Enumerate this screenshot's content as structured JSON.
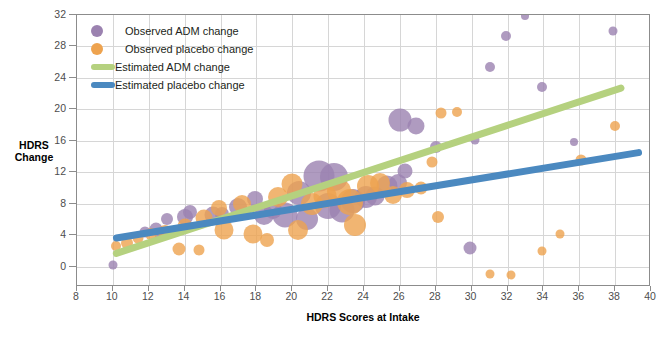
{
  "chart_data": {
    "type": "scatter",
    "title": "",
    "xlabel": "HDRS Scores at Intake",
    "ylabel": "HDRS Change",
    "ylabel_line1": "HDRS",
    "ylabel_line2": "Change",
    "xlim": [
      8,
      40
    ],
    "ylim": [
      -2.6,
      32
    ],
    "xticks": [
      8,
      10,
      12,
      14,
      16,
      18,
      20,
      22,
      24,
      26,
      28,
      30,
      32,
      34,
      36,
      38,
      40
    ],
    "yticks": [
      0,
      4,
      8,
      12,
      16,
      20,
      24,
      28,
      32
    ],
    "grid": true,
    "legend_position": "top-left",
    "colors": {
      "adm_marker": "#9b82b0",
      "placebo_marker": "#eea34f",
      "adm_line": "#b5d17f",
      "placebo_line": "#4b89c0",
      "grid": "#d6d6d6",
      "axis": "#8c8c8c"
    },
    "legend": [
      {
        "label": "Observed ADM change",
        "kind": "dot",
        "color": "#9b82b0"
      },
      {
        "label": "Observed placebo change",
        "kind": "dot",
        "color": "#eea34f"
      },
      {
        "label": "Estimated ADM change",
        "kind": "line",
        "color": "#b5d17f"
      },
      {
        "label": "Estimated placebo change",
        "kind": "line",
        "color": "#4b89c0"
      }
    ],
    "series": [
      {
        "name": "Observed ADM change",
        "marker": "bubble",
        "color": "#9b82b0",
        "points": [
          {
            "x": 10.0,
            "y": 0.2,
            "s": 4.5
          },
          {
            "x": 11.8,
            "y": 4.4,
            "s": 5.5
          },
          {
            "x": 12.4,
            "y": 4.8,
            "s": 6.5
          },
          {
            "x": 13.0,
            "y": 6.1,
            "s": 6.0
          },
          {
            "x": 12.6,
            "y": 3.9,
            "s": 5.0
          },
          {
            "x": 14.0,
            "y": 6.3,
            "s": 8.0
          },
          {
            "x": 14.3,
            "y": 7.0,
            "s": 7.0
          },
          {
            "x": 15.6,
            "y": 6.5,
            "s": 8.5
          },
          {
            "x": 16.1,
            "y": 6.7,
            "s": 7.0
          },
          {
            "x": 17.0,
            "y": 7.6,
            "s": 9.0
          },
          {
            "x": 17.9,
            "y": 8.6,
            "s": 8.0
          },
          {
            "x": 18.4,
            "y": 6.6,
            "s": 10.0
          },
          {
            "x": 18.9,
            "y": 7.2,
            "s": 9.0
          },
          {
            "x": 19.6,
            "y": 6.6,
            "s": 12.5
          },
          {
            "x": 20.4,
            "y": 9.4,
            "s": 12.0
          },
          {
            "x": 20.8,
            "y": 6.0,
            "s": 11.0
          },
          {
            "x": 21.5,
            "y": 11.5,
            "s": 15.5
          },
          {
            "x": 22.3,
            "y": 11.4,
            "s": 14.0
          },
          {
            "x": 22.0,
            "y": 7.7,
            "s": 13.0
          },
          {
            "x": 22.8,
            "y": 7.2,
            "s": 12.5
          },
          {
            "x": 23.4,
            "y": 8.3,
            "s": 12.0
          },
          {
            "x": 24.1,
            "y": 8.8,
            "s": 11.0
          },
          {
            "x": 24.6,
            "y": 9.0,
            "s": 9.5
          },
          {
            "x": 25.3,
            "y": 10.2,
            "s": 10.5
          },
          {
            "x": 25.9,
            "y": 10.6,
            "s": 9.0
          },
          {
            "x": 26.3,
            "y": 12.2,
            "s": 7.5
          },
          {
            "x": 26.0,
            "y": 18.6,
            "s": 11.5
          },
          {
            "x": 26.9,
            "y": 17.9,
            "s": 8.5
          },
          {
            "x": 28.0,
            "y": 15.2,
            "s": 6.0
          },
          {
            "x": 29.9,
            "y": 2.3,
            "s": 6.5
          },
          {
            "x": 30.2,
            "y": 16.1,
            "s": 4.5
          },
          {
            "x": 31.0,
            "y": 25.4,
            "s": 5.0
          },
          {
            "x": 31.9,
            "y": 29.3,
            "s": 5.0
          },
          {
            "x": 33.0,
            "y": 31.9,
            "s": 4.0
          },
          {
            "x": 33.9,
            "y": 22.9,
            "s": 5.0
          },
          {
            "x": 35.7,
            "y": 15.9,
            "s": 4.0
          },
          {
            "x": 37.9,
            "y": 30.0,
            "s": 4.5
          }
        ]
      },
      {
        "name": "Observed placebo change",
        "marker": "bubble",
        "color": "#eea34f",
        "points": [
          {
            "x": 10.2,
            "y": 2.6,
            "s": 5.0
          },
          {
            "x": 10.8,
            "y": 3.0,
            "s": 6.0
          },
          {
            "x": 11.4,
            "y": 3.6,
            "s": 5.5
          },
          {
            "x": 12.1,
            "y": 4.1,
            "s": 6.0
          },
          {
            "x": 12.9,
            "y": 4.4,
            "s": 7.0
          },
          {
            "x": 13.7,
            "y": 2.2,
            "s": 6.5
          },
          {
            "x": 14.0,
            "y": 5.2,
            "s": 7.5
          },
          {
            "x": 14.8,
            "y": 2.1,
            "s": 5.5
          },
          {
            "x": 15.1,
            "y": 6.2,
            "s": 8.5
          },
          {
            "x": 15.9,
            "y": 7.5,
            "s": 8.0
          },
          {
            "x": 16.2,
            "y": 4.6,
            "s": 9.5
          },
          {
            "x": 17.2,
            "y": 7.9,
            "s": 9.0
          },
          {
            "x": 17.8,
            "y": 4.1,
            "s": 9.5
          },
          {
            "x": 18.6,
            "y": 3.4,
            "s": 7.0
          },
          {
            "x": 19.2,
            "y": 8.9,
            "s": 10.0
          },
          {
            "x": 20.0,
            "y": 10.5,
            "s": 10.5
          },
          {
            "x": 20.3,
            "y": 4.6,
            "s": 10.0
          },
          {
            "x": 21.1,
            "y": 7.9,
            "s": 11.0
          },
          {
            "x": 21.8,
            "y": 9.0,
            "s": 11.5
          },
          {
            "x": 22.6,
            "y": 9.6,
            "s": 12.0
          },
          {
            "x": 23.2,
            "y": 8.2,
            "s": 13.0
          },
          {
            "x": 23.5,
            "y": 5.3,
            "s": 11.0
          },
          {
            "x": 24.2,
            "y": 10.3,
            "s": 11.0
          },
          {
            "x": 24.9,
            "y": 10.6,
            "s": 10.0
          },
          {
            "x": 25.6,
            "y": 9.1,
            "s": 9.0
          },
          {
            "x": 26.4,
            "y": 9.8,
            "s": 8.0
          },
          {
            "x": 27.2,
            "y": 10.0,
            "s": 6.5
          },
          {
            "x": 27.8,
            "y": 13.3,
            "s": 5.5
          },
          {
            "x": 28.3,
            "y": 19.5,
            "s": 5.5
          },
          {
            "x": 28.1,
            "y": 6.3,
            "s": 6.0
          },
          {
            "x": 29.2,
            "y": 19.7,
            "s": 5.0
          },
          {
            "x": 31.0,
            "y": -1.0,
            "s": 4.5
          },
          {
            "x": 32.2,
            "y": -1.1,
            "s": 4.5
          },
          {
            "x": 33.9,
            "y": 2.0,
            "s": 4.5
          },
          {
            "x": 34.9,
            "y": 4.1,
            "s": 4.5
          },
          {
            "x": 36.1,
            "y": 13.6,
            "s": 5.5
          },
          {
            "x": 38.0,
            "y": 17.9,
            "s": 5.0
          }
        ]
      }
    ],
    "fits": [
      {
        "name": "Estimated ADM change",
        "color": "#b5d17f",
        "x0": 10.0,
        "y0": 1.5,
        "x1": 38.5,
        "y1": 22.8,
        "width": 7
      },
      {
        "name": "Estimated placebo change",
        "color": "#4b89c0",
        "x0": 10.0,
        "y0": 3.6,
        "x1": 39.5,
        "y1": 14.6,
        "width": 7
      }
    ]
  }
}
